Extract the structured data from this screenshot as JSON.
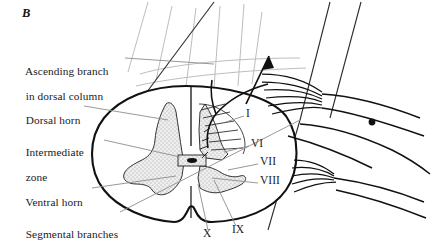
{
  "figure": {
    "panel_letter": "B",
    "background_color": "#ffffff",
    "ink_color": "#1b1b1b",
    "grey_matter_fill": "#e9e9e9",
    "fiber_color": "#b9b9b9",
    "leader_color": "#8c8c8c"
  },
  "labels": [
    {
      "id": "ascending-branch",
      "line1": "Ascending branch",
      "line2": "in dorsal column",
      "x": 14,
      "y": 53
    },
    {
      "id": "dorsal-horn",
      "line1": "Dorsal horn",
      "line2": "",
      "x": 14,
      "y": 102
    },
    {
      "id": "intermediate-zone",
      "line1": "Intermediate",
      "line2": "zone",
      "x": 14,
      "y": 134
    },
    {
      "id": "ventral-horn",
      "line1": "Ventral horn",
      "line2": "",
      "x": 14,
      "y": 184
    },
    {
      "id": "segmental-branches",
      "line1": "Segmental branches",
      "line2": "",
      "x": 14,
      "y": 216
    }
  ],
  "laminae": [
    {
      "id": "lamina-1",
      "numeral": "I",
      "x": 246,
      "y": 113
    },
    {
      "id": "lamina-6",
      "numeral": "VI",
      "x": 251,
      "y": 143
    },
    {
      "id": "lamina-7",
      "numeral": "VII",
      "x": 260,
      "y": 161
    },
    {
      "id": "lamina-8",
      "numeral": "VIII",
      "x": 260,
      "y": 180
    },
    {
      "id": "lamina-9",
      "numeral": "IX",
      "x": 232,
      "y": 229
    },
    {
      "id": "lamina-10",
      "numeral": "X",
      "x": 203,
      "y": 233
    }
  ]
}
